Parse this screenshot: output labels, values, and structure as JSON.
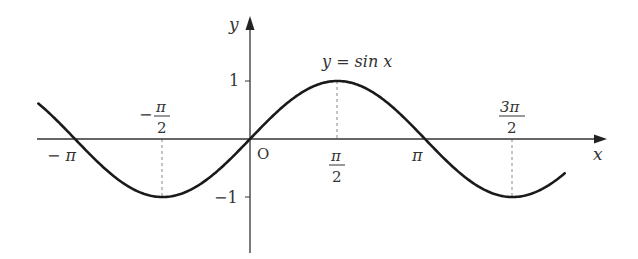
{
  "chart_data": {
    "type": "line",
    "title": "y = sin x",
    "function": "sin",
    "series": [
      {
        "name": "y = sin x",
        "x_label_points": [
          "-π",
          "-π/2",
          "0",
          "π/2",
          "π",
          "3π/2"
        ],
        "x": [
          -3.14159,
          -1.5708,
          0,
          1.5708,
          3.14159,
          4.71239
        ],
        "values": [
          0,
          -1,
          0,
          1,
          0,
          -1
        ]
      }
    ],
    "x_range_plotted": [
      -3.8,
      5.65
    ],
    "xlabel": "x",
    "ylabel": "y",
    "x_ticks": [
      "-π",
      "-π/2",
      "O",
      "π/2",
      "π",
      "3π/2"
    ],
    "y_ticks": [
      "1",
      "-1"
    ],
    "ylim": [
      -1.9,
      2.1
    ],
    "grid": false,
    "legend": "none",
    "annotations": [
      "y = sin x",
      "dashed guides at x = -π/2, π/2, 3π/2"
    ]
  },
  "labels": {
    "y_axis": "y",
    "x_axis": "x",
    "origin": "O",
    "curve_label": "y = sin x",
    "y_one": "1",
    "y_neg_one": "−1",
    "neg_pi": "− π",
    "pi": "π",
    "neg_half_pi_sign": "−",
    "pi_sym": "π",
    "two": "2",
    "three_pi": "3π"
  },
  "colors": {
    "curve": "#1a1a1a",
    "axis": "#333333",
    "guide": "#777777"
  }
}
